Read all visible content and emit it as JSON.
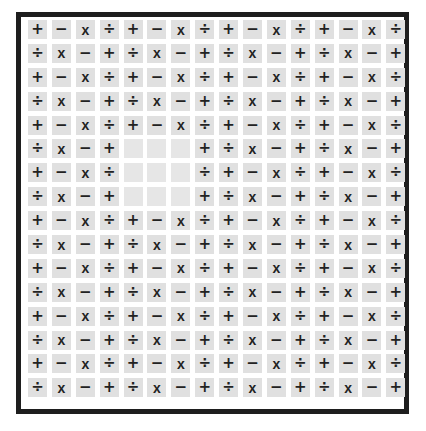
{
  "puzzle": {
    "rows": 16,
    "cols": 16,
    "colors": {
      "frame": "#1e1e1e",
      "cell_bg": "#e0e0e0",
      "symbol": "#222222",
      "page_bg": "#ffffff"
    },
    "symbols": {
      "plus": "+",
      "minus": "−",
      "times": "x",
      "divide": "÷"
    },
    "row_patterns": {
      "odd": [
        "+",
        "−",
        "x",
        "÷"
      ],
      "even": [
        "÷",
        "x",
        "−",
        "+"
      ]
    },
    "blank_region": {
      "rows": [
        6,
        7,
        8
      ],
      "cols": [
        5,
        6,
        7
      ]
    },
    "grid": [
      [
        "+",
        "−",
        "x",
        "÷",
        "+",
        "−",
        "x",
        "÷",
        "+",
        "−",
        "x",
        "÷",
        "+",
        "−",
        "x",
        "÷"
      ],
      [
        "÷",
        "x",
        "−",
        "+",
        "÷",
        "x",
        "−",
        "+",
        "÷",
        "x",
        "−",
        "+",
        "÷",
        "x",
        "−",
        "+"
      ],
      [
        "+",
        "−",
        "x",
        "÷",
        "+",
        "−",
        "x",
        "÷",
        "+",
        "−",
        "x",
        "÷",
        "+",
        "−",
        "x",
        "÷"
      ],
      [
        "÷",
        "x",
        "−",
        "+",
        "÷",
        "x",
        "−",
        "+",
        "÷",
        "x",
        "−",
        "+",
        "÷",
        "x",
        "−",
        "+"
      ],
      [
        "+",
        "−",
        "x",
        "÷",
        "+",
        "−",
        "x",
        "÷",
        "+",
        "−",
        "x",
        "÷",
        "+",
        "−",
        "x",
        "÷"
      ],
      [
        "÷",
        "x",
        "−",
        "+",
        "",
        "",
        "",
        "+",
        "÷",
        "x",
        "−",
        "+",
        "÷",
        "x",
        "−",
        "+"
      ],
      [
        "+",
        "−",
        "x",
        "÷",
        "",
        "",
        "",
        "÷",
        "+",
        "−",
        "x",
        "÷",
        "+",
        "−",
        "x",
        "÷"
      ],
      [
        "÷",
        "x",
        "−",
        "+",
        "",
        "",
        "",
        "+",
        "÷",
        "x",
        "−",
        "+",
        "÷",
        "x",
        "−",
        "+"
      ],
      [
        "+",
        "−",
        "x",
        "÷",
        "+",
        "−",
        "x",
        "÷",
        "+",
        "−",
        "x",
        "÷",
        "+",
        "−",
        "x",
        "÷"
      ],
      [
        "÷",
        "x",
        "−",
        "+",
        "÷",
        "x",
        "−",
        "+",
        "÷",
        "x",
        "−",
        "+",
        "÷",
        "x",
        "−",
        "+"
      ],
      [
        "+",
        "−",
        "x",
        "÷",
        "+",
        "−",
        "x",
        "÷",
        "+",
        "−",
        "x",
        "÷",
        "+",
        "−",
        "x",
        "÷"
      ],
      [
        "÷",
        "x",
        "−",
        "+",
        "÷",
        "x",
        "−",
        "+",
        "÷",
        "x",
        "−",
        "+",
        "÷",
        "x",
        "−",
        "+"
      ],
      [
        "+",
        "−",
        "x",
        "÷",
        "+",
        "−",
        "x",
        "÷",
        "+",
        "−",
        "x",
        "÷",
        "+",
        "−",
        "x",
        "÷"
      ],
      [
        "÷",
        "x",
        "−",
        "+",
        "÷",
        "x",
        "−",
        "+",
        "÷",
        "x",
        "−",
        "+",
        "÷",
        "x",
        "−",
        "+"
      ],
      [
        "+",
        "−",
        "x",
        "÷",
        "+",
        "−",
        "x",
        "÷",
        "+",
        "−",
        "x",
        "÷",
        "+",
        "−",
        "x",
        "÷"
      ],
      [
        "÷",
        "x",
        "−",
        "+",
        "÷",
        "x",
        "−",
        "+",
        "÷",
        "x",
        "−",
        "+",
        "÷",
        "x",
        "−",
        "+"
      ]
    ]
  }
}
